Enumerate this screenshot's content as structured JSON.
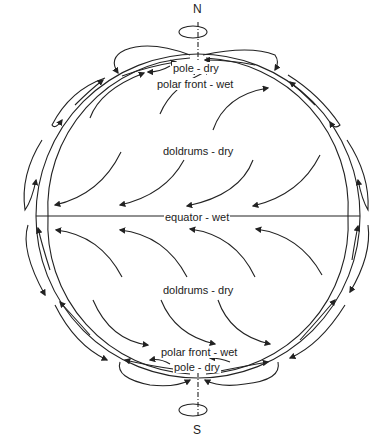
{
  "diagram": {
    "title": "",
    "labels": {
      "north": "N",
      "south": "S",
      "pole_top": "pole - dry",
      "polar_front_top": "polar front - wet",
      "doldrums_top": "doldrums - dry",
      "equator": "equator - wet",
      "doldrums_bottom": "doldrums - dry",
      "polar_front_bottom": "polar front - wet",
      "pole_bottom": "pole - dry"
    },
    "colors": {
      "line": "#222222",
      "background": "#ffffff"
    }
  }
}
